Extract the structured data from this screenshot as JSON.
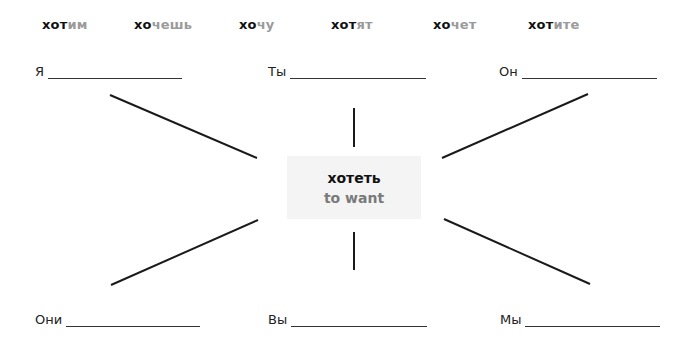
{
  "forms": [
    {
      "stem": "хот",
      "ending": "им"
    },
    {
      "stem": "хо",
      "ending": "чешь"
    },
    {
      "stem": "хо",
      "ending": "чу"
    },
    {
      "stem": "хот",
      "ending": "ят"
    },
    {
      "stem": "хо",
      "ending": "чет"
    },
    {
      "stem": "хот",
      "ending": "ите"
    }
  ],
  "pronouns": {
    "top_left": "Я",
    "top_center": "Ты",
    "top_right": "Он",
    "bottom_left": "Они",
    "bottom_center": "Вы",
    "bottom_right": "Мы"
  },
  "center": {
    "verb": "хотеть",
    "translation": "to want"
  },
  "colors": {
    "stem": "#111111",
    "ending": "#9a9a9a",
    "box_bg": "#f4f4f4",
    "translation": "#7a7a7a"
  }
}
